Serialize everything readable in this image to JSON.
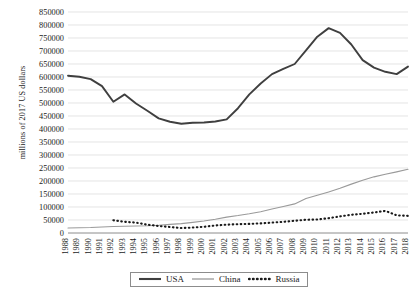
{
  "chart_data": {
    "type": "line",
    "title": "",
    "xlabel": "",
    "ylabel": "millions of 2017 US dollars",
    "ylim": [
      0,
      850000
    ],
    "ytick_step": 50000,
    "grid": true,
    "legend_position": "bottom",
    "yticks": [
      "850000",
      "800000",
      "750000",
      "700000",
      "650000",
      "600000",
      "550000",
      "500000",
      "450000",
      "400000",
      "350000",
      "300000",
      "250000",
      "200000",
      "150000",
      "100000",
      "50000",
      "0"
    ],
    "categories": [
      "1988",
      "1989",
      "1990",
      "1991",
      "1992",
      "1993",
      "1994",
      "1995",
      "1996",
      "1997",
      "1998",
      "1999",
      "2000",
      "2001",
      "2002",
      "2003",
      "2004",
      "2005",
      "2006",
      "2007",
      "2008",
      "2009",
      "2010",
      "2011",
      "2012",
      "2013",
      "2014",
      "2015",
      "2016",
      "2017",
      "2018"
    ],
    "series": [
      {
        "name": "USA",
        "color": "#3f3f3f",
        "style": "solid-thick",
        "values": [
          605000,
          601000,
          592000,
          565000,
          505000,
          533000,
          498000,
          470000,
          441000,
          428000,
          420000,
          424000,
          425000,
          429000,
          437000,
          480000,
          533000,
          575000,
          611000,
          631000,
          650000,
          702000,
          755000,
          788000,
          770000,
          725000,
          665000,
          636000,
          620000,
          611000,
          640000
        ]
      },
      {
        "name": "China",
        "color": "#9a9a9a",
        "style": "solid-thin",
        "values": [
          19000,
          20000,
          21000,
          23000,
          25000,
          26000,
          27000,
          28000,
          30000,
          33000,
          36000,
          41000,
          46000,
          53000,
          61000,
          67000,
          74000,
          82000,
          92000,
          102000,
          112000,
          133000,
          145000,
          158000,
          172000,
          188000,
          203000,
          216000,
          226000,
          235000,
          245000
        ]
      },
      {
        "name": "Russia",
        "color": "#1a1a1a",
        "style": "dotted",
        "start_year": "1992",
        "values": [
          null,
          null,
          null,
          null,
          49000,
          43000,
          40000,
          32000,
          27000,
          23000,
          19000,
          21000,
          24000,
          29000,
          32000,
          34000,
          35000,
          37000,
          40000,
          43000,
          47000,
          51000,
          52000,
          57000,
          64000,
          70000,
          74000,
          79000,
          85000,
          68000,
          66000
        ]
      }
    ]
  },
  "legend": {
    "items": [
      {
        "label": "USA"
      },
      {
        "label": "China"
      },
      {
        "label": "Russia"
      }
    ]
  }
}
